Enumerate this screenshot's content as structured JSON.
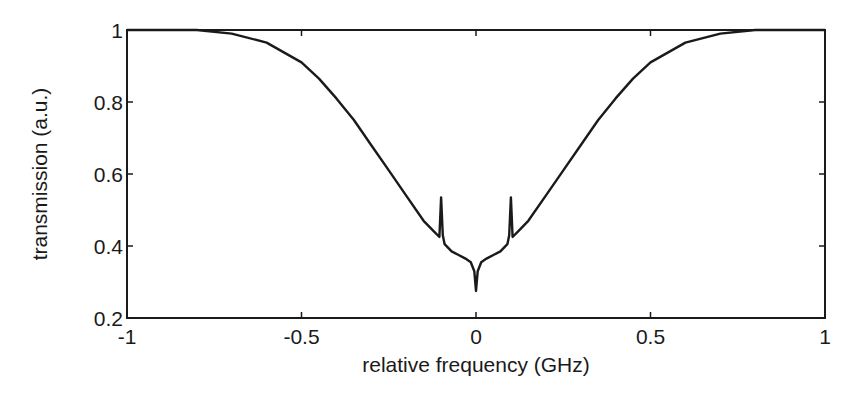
{
  "chart_data": {
    "type": "line",
    "title": "",
    "xlabel": "relative frequency (GHz)",
    "ylabel": "transmission (a.u.)",
    "xlim": [
      -1,
      1
    ],
    "ylim": [
      0.2,
      1
    ],
    "xticks": [
      "-1",
      "-0.5",
      "0",
      "0.5",
      "1"
    ],
    "yticks": [
      "0.2",
      "0.4",
      "0.6",
      "0.8",
      "1"
    ],
    "grid": false,
    "legend": null,
    "series": [
      {
        "name": "transmission",
        "color": "#1a1a1a",
        "x": [
          -1.0,
          -0.8,
          -0.7,
          -0.6,
          -0.5,
          -0.45,
          -0.4,
          -0.35,
          -0.3,
          -0.25,
          -0.2,
          -0.15,
          -0.12,
          -0.105,
          -0.1,
          -0.095,
          -0.09,
          -0.07,
          -0.05,
          -0.03,
          -0.015,
          -0.005,
          0.0,
          0.005,
          0.015,
          0.03,
          0.05,
          0.07,
          0.09,
          0.095,
          0.1,
          0.105,
          0.12,
          0.15,
          0.2,
          0.25,
          0.3,
          0.35,
          0.4,
          0.45,
          0.5,
          0.6,
          0.7,
          0.8,
          1.0
        ],
        "y": [
          1.0,
          1.0,
          0.99,
          0.965,
          0.91,
          0.865,
          0.81,
          0.75,
          0.68,
          0.61,
          0.54,
          0.47,
          0.44,
          0.425,
          0.535,
          0.43,
          0.405,
          0.385,
          0.375,
          0.365,
          0.355,
          0.33,
          0.275,
          0.33,
          0.355,
          0.365,
          0.375,
          0.385,
          0.405,
          0.43,
          0.535,
          0.425,
          0.44,
          0.47,
          0.54,
          0.61,
          0.68,
          0.75,
          0.81,
          0.865,
          0.91,
          0.965,
          0.99,
          1.0,
          1.0
        ]
      }
    ]
  },
  "axes": {
    "xlabel": "relative frequency (GHz)",
    "ylabel": "transmission (a.u.)"
  }
}
